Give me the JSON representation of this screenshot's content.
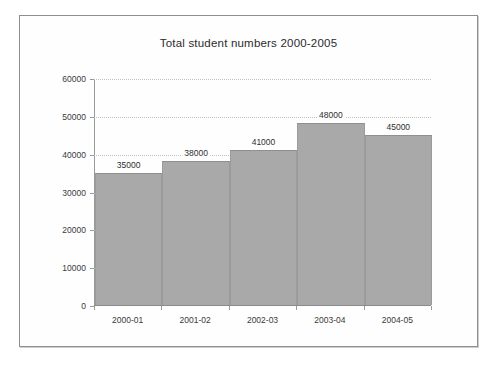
{
  "chart_data": {
    "type": "bar",
    "title": "Total student numbers 2000-2005",
    "xlabel": "",
    "ylabel": "",
    "categories": [
      "2000-01",
      "2001-02",
      "2002-03",
      "2003-04",
      "2004-05"
    ],
    "values": [
      35000,
      38000,
      41000,
      48000,
      45000
    ],
    "data_labels": [
      "35000",
      "38000",
      "41000",
      "48000",
      "45000"
    ],
    "ylim": [
      0,
      60000
    ],
    "y_ticks": [
      0,
      10000,
      20000,
      30000,
      40000,
      50000,
      60000
    ],
    "y_tick_labels": [
      "0",
      "10000",
      "20000",
      "30000",
      "40000",
      "50000",
      "60000"
    ],
    "grid": true,
    "grid_style": "dotted",
    "legend": false,
    "bar_color": "#a9a9a9",
    "bar_gap": 0,
    "background_color": "#ffffff",
    "axis_color": "#9a9a9a",
    "gridline_color": "#c2c2c2",
    "text_color": "#2f2f2f"
  }
}
